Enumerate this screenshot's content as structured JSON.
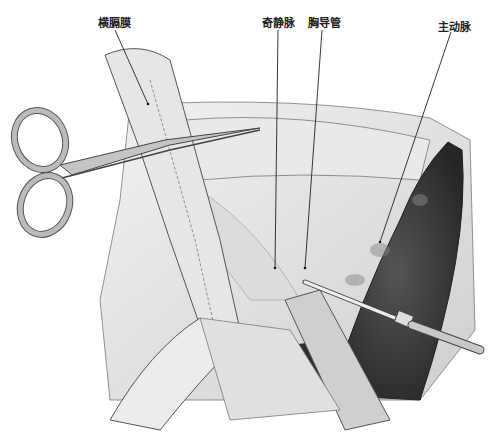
{
  "figure": {
    "caption_partial": "",
    "labels": [
      {
        "id": "diaphragm",
        "text": "横膈膜",
        "x": 98,
        "y": 14
      },
      {
        "id": "azygos",
        "text": "奇静脉",
        "x": 264,
        "y": 14
      },
      {
        "id": "thoracic_duct",
        "text": "胸导管",
        "x": 309,
        "y": 14
      },
      {
        "id": "aorta",
        "text": "主动脉",
        "x": 440,
        "y": 18
      }
    ],
    "colors": {
      "aorta": "#3a3a3a",
      "tissue": "#e2e2e2",
      "outline": "#555555",
      "instrument": "#bdbdbd"
    }
  }
}
